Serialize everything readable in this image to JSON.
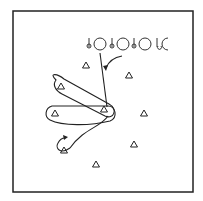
{
  "diagram": {
    "type": "drill-diagram",
    "frame": {
      "x": 13,
      "y": 11,
      "width": 180,
      "height": 181
    },
    "colors": {
      "line": "#222222",
      "background": "#ffffff"
    },
    "players_in_line": [
      {
        "label": "player-1",
        "x": 97,
        "y": 46
      },
      {
        "label": "player-2",
        "x": 126,
        "y": 46
      },
      {
        "label": "player-3",
        "x": 154,
        "y": 46
      }
    ],
    "cones": [
      {
        "x": 86,
        "y": 65
      },
      {
        "x": 129,
        "y": 75
      },
      {
        "x": 61,
        "y": 86
      },
      {
        "x": 104,
        "y": 109
      },
      {
        "x": 55,
        "y": 113
      },
      {
        "x": 144,
        "y": 113
      },
      {
        "x": 134,
        "y": 144
      },
      {
        "x": 64,
        "y": 150
      },
      {
        "x": 96,
        "y": 164
      }
    ]
  }
}
